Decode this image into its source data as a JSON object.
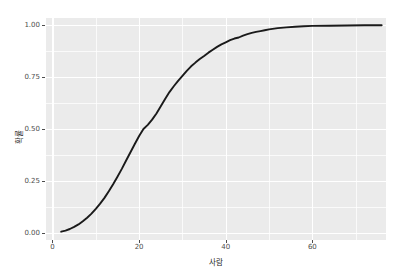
{
  "chart_data": {
    "type": "line",
    "title": "",
    "subtitle": "",
    "xlabel": "사람",
    "ylabel": "확률",
    "xlim": [
      -1.5,
      77
    ],
    "ylim": [
      -0.035,
      1.035
    ],
    "grid": true,
    "legend": null,
    "x_ticks": [
      0,
      20,
      40,
      60
    ],
    "x_tick_labels": [
      "0",
      "20",
      "40",
      "60"
    ],
    "x_minor_ticks": [
      10,
      30,
      50,
      70
    ],
    "y_ticks": [
      0.0,
      0.25,
      0.5,
      0.75,
      1.0
    ],
    "y_tick_labels": [
      "0.00",
      "0.25",
      "0.50",
      "0.75",
      "1.00"
    ],
    "y_minor_ticks": [
      0.125,
      0.375,
      0.625,
      0.875
    ],
    "series": [
      {
        "name": "ecdf",
        "color": "#1a1a1a",
        "line_width": 1.9,
        "x": [
          2.0,
          3.0,
          4.0,
          5.0,
          6.0,
          7.0,
          8.0,
          9.0,
          10.0,
          11.0,
          12.0,
          13.0,
          14.0,
          15.0,
          16.0,
          17.0,
          18.0,
          19.0,
          20.0,
          21.0,
          22.0,
          23.0,
          24.0,
          25.0,
          26.0,
          27.0,
          28.0,
          29.0,
          30.0,
          31.0,
          32.0,
          33.0,
          34.0,
          35.0,
          36.0,
          37.0,
          38.0,
          39.0,
          40.0,
          41.0,
          42.0,
          43.0,
          44.0,
          45.0,
          46.0,
          47.0,
          48.0,
          49.0,
          50.0,
          52.0,
          54.0,
          56.0,
          58.0,
          60.0,
          64.0,
          68.0,
          72.0,
          76.0
        ],
        "y": [
          0.005,
          0.01,
          0.018,
          0.028,
          0.04,
          0.055,
          0.072,
          0.092,
          0.115,
          0.14,
          0.168,
          0.2,
          0.234,
          0.27,
          0.308,
          0.348,
          0.388,
          0.428,
          0.466,
          0.5,
          0.52,
          0.545,
          0.575,
          0.61,
          0.645,
          0.678,
          0.706,
          0.732,
          0.756,
          0.78,
          0.802,
          0.82,
          0.837,
          0.852,
          0.868,
          0.882,
          0.896,
          0.908,
          0.918,
          0.928,
          0.936,
          0.941,
          0.95,
          0.957,
          0.963,
          0.968,
          0.972,
          0.976,
          0.98,
          0.986,
          0.99,
          0.993,
          0.995,
          0.997,
          0.998,
          0.999,
          1.0,
          1.0
        ]
      }
    ]
  },
  "panel": {
    "background_color": "#ebebeb",
    "grid_color": "#ffffff"
  },
  "axes": {
    "tick_label_color": "#4d4d4d",
    "axis_title_color": "#1a1a1a"
  }
}
